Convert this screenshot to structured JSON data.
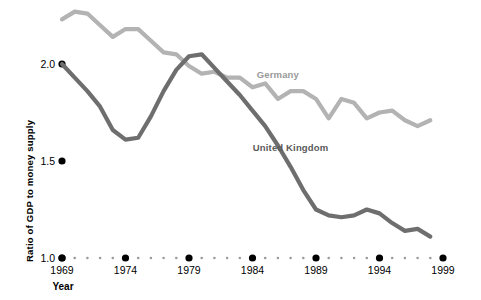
{
  "chart_data": {
    "type": "line",
    "title": "",
    "xlabel": "Year",
    "ylabel": "Ratio of GDP to money supply",
    "xlim": [
      1969,
      1999
    ],
    "ylim": [
      1.0,
      2.3
    ],
    "yticks": [
      "2.0",
      "1.5",
      "1.0"
    ],
    "ytick_values": [
      2.0,
      1.5,
      1.0
    ],
    "xticks": [
      "1969",
      "1974",
      "1979",
      "1984",
      "1989",
      "1994",
      "1999"
    ],
    "xtick_values": [
      1969,
      1974,
      1979,
      1984,
      1989,
      1994,
      1999
    ],
    "grid": false,
    "legend_position": "inline-annotation",
    "x": [
      1969,
      1970,
      1971,
      1972,
      1973,
      1974,
      1975,
      1976,
      1977,
      1978,
      1979,
      1980,
      1981,
      1982,
      1983,
      1984,
      1985,
      1986,
      1987,
      1988,
      1989,
      1990,
      1991,
      1992,
      1993,
      1994,
      1995,
      1996,
      1997,
      1998
    ],
    "series": [
      {
        "name": "Germany",
        "color": "#b3b3b3",
        "label_color": "#9a9a9a",
        "values": [
          2.23,
          2.27,
          2.26,
          2.2,
          2.14,
          2.18,
          2.18,
          2.12,
          2.06,
          2.05,
          1.99,
          1.95,
          1.96,
          1.93,
          1.93,
          1.88,
          1.9,
          1.82,
          1.86,
          1.86,
          1.82,
          1.72,
          1.82,
          1.8,
          1.72,
          1.75,
          1.76,
          1.71,
          1.68,
          1.71
        ]
      },
      {
        "name": "United Kingdom",
        "color": "#6e6e6e",
        "label_color": "#5a5a5a",
        "values": [
          2.0,
          1.93,
          1.86,
          1.78,
          1.66,
          1.61,
          1.62,
          1.73,
          1.86,
          1.97,
          2.04,
          2.05,
          1.98,
          1.91,
          1.84,
          1.76,
          1.68,
          1.58,
          1.47,
          1.35,
          1.25,
          1.22,
          1.21,
          1.22,
          1.25,
          1.23,
          1.18,
          1.14,
          1.15,
          1.11
        ]
      }
    ],
    "annotations": [
      {
        "text": "Germany",
        "series": "Germany",
        "x": 1986,
        "y": 1.93
      },
      {
        "text": "United Kingdom",
        "series": "United Kingdom",
        "x": 1987,
        "y": 1.55
      }
    ]
  },
  "axis": {
    "y_title": "Ratio of GDP to money supply",
    "x_title": "Year",
    "tick_marker_shape": "dot",
    "minor_tick_shape": "small-dot"
  }
}
